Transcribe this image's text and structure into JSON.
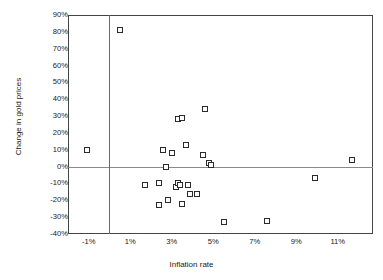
{
  "chart_data": {
    "type": "scatter",
    "title": "",
    "xlabel": "Inflation rate",
    "ylabel": "Change in gold prices",
    "xlim": [
      -2,
      12.7
    ],
    "ylim": [
      -40,
      90
    ],
    "xticks": [
      "-1%",
      "1%",
      "3%",
      "5%",
      "7%",
      "9%",
      "11%"
    ],
    "xtick_values": [
      -1,
      1,
      3,
      5,
      7,
      9,
      11
    ],
    "yticks": [
      "90%",
      "80%",
      "70%",
      "60%",
      "50%",
      "40%",
      "30%",
      "20%",
      "10%",
      "0%",
      "-10%",
      "-20%",
      "-30%",
      "-40%"
    ],
    "ytick_values": [
      90,
      80,
      70,
      60,
      50,
      40,
      30,
      20,
      10,
      0,
      -10,
      -20,
      -30,
      -40
    ],
    "grid": false,
    "legend": null,
    "marker": "open-square",
    "zero_lines": {
      "horizontal": 0,
      "vertical": 0
    },
    "points": [
      {
        "x": -1.1,
        "y": 10
      },
      {
        "x": 0.5,
        "y": 81
      },
      {
        "x": 1.7,
        "y": -11
      },
      {
        "x": 2.4,
        "y": -10
      },
      {
        "x": 2.4,
        "y": -23
      },
      {
        "x": 2.6,
        "y": 10
      },
      {
        "x": 2.7,
        "y": 0
      },
      {
        "x": 2.8,
        "y": -20
      },
      {
        "x": 3.0,
        "y": 8
      },
      {
        "x": 3.2,
        "y": -12
      },
      {
        "x": 3.3,
        "y": 28
      },
      {
        "x": 3.3,
        "y": -10
      },
      {
        "x": 3.4,
        "y": -11
      },
      {
        "x": 3.5,
        "y": 29
      },
      {
        "x": 3.5,
        "y": -22
      },
      {
        "x": 3.7,
        "y": 13
      },
      {
        "x": 3.8,
        "y": -11
      },
      {
        "x": 3.9,
        "y": -16
      },
      {
        "x": 4.2,
        "y": -16
      },
      {
        "x": 4.5,
        "y": 7
      },
      {
        "x": 4.6,
        "y": 34
      },
      {
        "x": 4.8,
        "y": 2
      },
      {
        "x": 4.9,
        "y": 1
      },
      {
        "x": 5.5,
        "y": -33
      },
      {
        "x": 7.6,
        "y": -32
      },
      {
        "x": 9.9,
        "y": -7
      },
      {
        "x": 11.7,
        "y": 4
      }
    ]
  }
}
